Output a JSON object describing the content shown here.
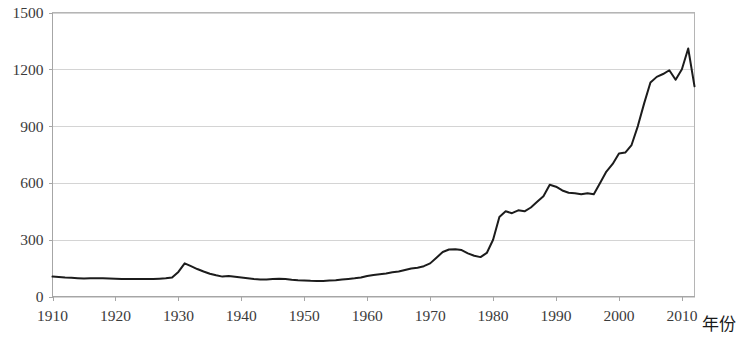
{
  "chart_data": {
    "type": "line",
    "title": "",
    "subtitle": "",
    "xlabel": "年份",
    "ylabel": "",
    "xlim": [
      1910,
      2012
    ],
    "ylim": [
      0,
      1500
    ],
    "grid": true,
    "legend": null,
    "legend_position": "none",
    "series_color": "#1c1c1c",
    "gridline_color": "#d4d4d4",
    "axis_color": "#a6a6a6",
    "y_ticks": [
      0,
      300,
      600,
      900,
      1200,
      1500
    ],
    "y_tick_labels": [
      "0",
      "300",
      "600",
      "900",
      "1200",
      "1500"
    ],
    "x_ticks": [
      1910,
      1920,
      1930,
      1940,
      1950,
      1960,
      1970,
      1980,
      1990,
      2000,
      2010
    ],
    "x_tick_labels": [
      "1910",
      "1920",
      "1930",
      "1940",
      "1950",
      "1960",
      "1970",
      "1980",
      "1990",
      "2000",
      "2010"
    ],
    "x": [
      1910,
      1911,
      1912,
      1913,
      1914,
      1915,
      1916,
      1917,
      1918,
      1919,
      1920,
      1921,
      1922,
      1923,
      1924,
      1925,
      1926,
      1927,
      1928,
      1929,
      1930,
      1931,
      1932,
      1933,
      1934,
      1935,
      1936,
      1937,
      1938,
      1939,
      1940,
      1941,
      1942,
      1943,
      1944,
      1945,
      1946,
      1947,
      1948,
      1949,
      1950,
      1951,
      1952,
      1953,
      1954,
      1955,
      1956,
      1957,
      1958,
      1959,
      1960,
      1961,
      1962,
      1963,
      1964,
      1965,
      1966,
      1967,
      1968,
      1969,
      1970,
      1971,
      1972,
      1973,
      1974,
      1975,
      1976,
      1977,
      1978,
      1979,
      1980,
      1981,
      1982,
      1983,
      1984,
      1985,
      1986,
      1987,
      1988,
      1989,
      1990,
      1991,
      1992,
      1993,
      1994,
      1995,
      1996,
      1997,
      1998,
      1999,
      2000,
      2001,
      2002,
      2003,
      2004,
      2005,
      2006,
      2007,
      2008,
      2009,
      2010,
      2011,
      2012
    ],
    "values": [
      105,
      103,
      100,
      99,
      97,
      95,
      96,
      97,
      96,
      95,
      94,
      92,
      92,
      93,
      93,
      92,
      92,
      94,
      96,
      100,
      130,
      175,
      160,
      145,
      132,
      120,
      112,
      105,
      108,
      104,
      100,
      96,
      92,
      90,
      90,
      92,
      94,
      92,
      88,
      86,
      85,
      83,
      82,
      82,
      84,
      86,
      90,
      93,
      96,
      100,
      108,
      114,
      118,
      122,
      128,
      132,
      140,
      148,
      152,
      160,
      175,
      205,
      235,
      248,
      250,
      245,
      228,
      215,
      208,
      230,
      300,
      420,
      450,
      440,
      455,
      450,
      470,
      500,
      530,
      590,
      580,
      560,
      548,
      545,
      540,
      545,
      540,
      600,
      660,
      700,
      755,
      760,
      800,
      900,
      1020,
      1130,
      1160,
      1175,
      1195,
      1145,
      1200,
      1310,
      1110
    ]
  },
  "axis_title": {
    "x_axis_label": "年份"
  }
}
